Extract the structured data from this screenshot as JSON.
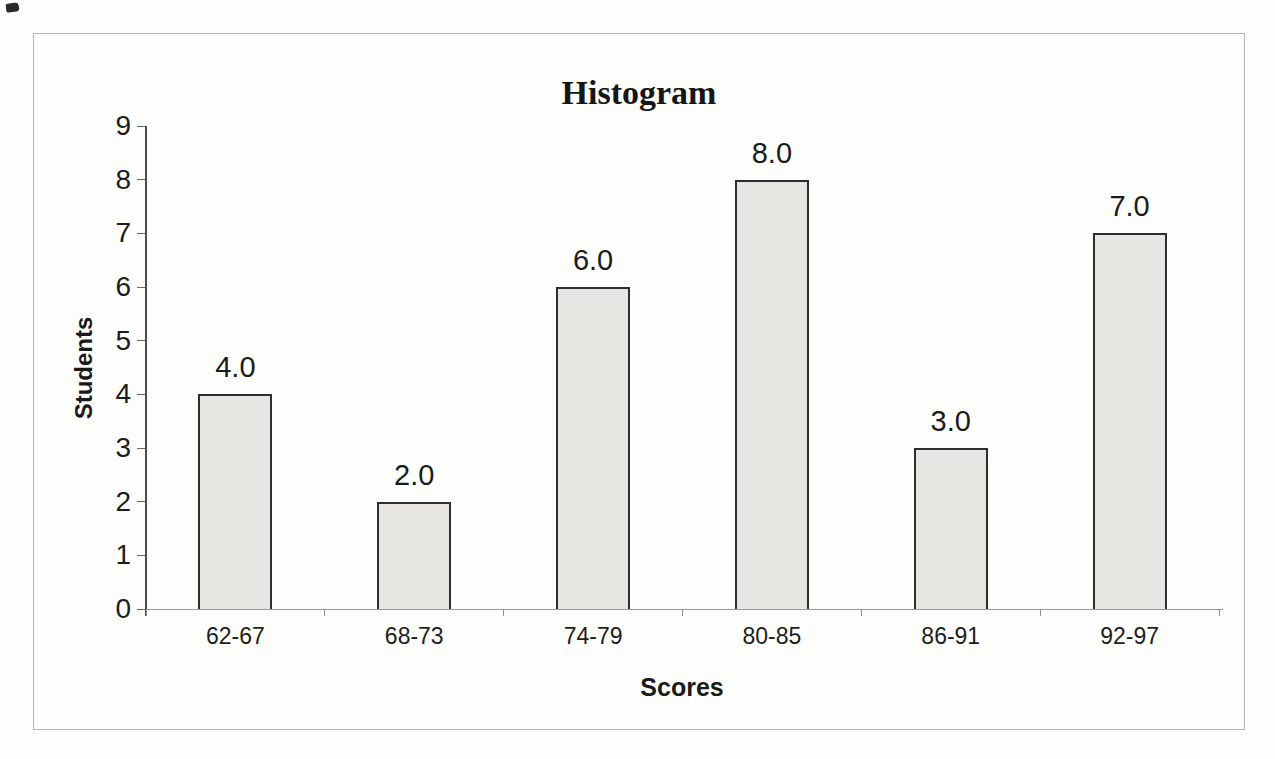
{
  "chart_data": {
    "type": "bar",
    "title": "Histogram",
    "xlabel": "Scores",
    "ylabel": "Students",
    "categories": [
      "62-67",
      "68-73",
      "74-79",
      "80-85",
      "86-91",
      "92-97"
    ],
    "values": [
      4.0,
      2.0,
      6.0,
      8.0,
      3.0,
      7.0
    ],
    "data_labels": [
      "4.0",
      "2.0",
      "6.0",
      "8.0",
      "3.0",
      "7.0"
    ],
    "y_ticks": [
      "0",
      "1",
      "2",
      "3",
      "4",
      "5",
      "6",
      "7",
      "8",
      "9"
    ],
    "ylim": [
      0,
      9
    ],
    "grid": false,
    "legend": "none",
    "colors": {
      "bar_fill": "#e7e6e2",
      "bar_border": "#2e2e2e",
      "text": "#1b1b1b",
      "axis_line": "#4c4c4c",
      "frame_border": "#b7b5b1"
    }
  }
}
